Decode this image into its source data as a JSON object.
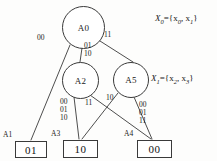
{
  "figure": {
    "type": "decision-diagram",
    "nodes": [
      {
        "id": "A0",
        "label": "A0",
        "cx": 83.5,
        "cy": 27,
        "r": 21
      },
      {
        "id": "A2",
        "label": "A2",
        "cx": 80,
        "cy": 80,
        "r": 18
      },
      {
        "id": "A5",
        "label": "A5",
        "cx": 130.5,
        "cy": 80,
        "r": 17.5
      }
    ],
    "terminals": [
      {
        "id": "A1",
        "name": "A1",
        "value": "01",
        "x": 15,
        "y": 141,
        "w": 30,
        "h": 15,
        "name_x": 3,
        "name_y": 131
      },
      {
        "id": "A3",
        "name": "A3",
        "value": "10",
        "x": 63,
        "y": 140,
        "w": 33,
        "h": 16,
        "name_x": 51,
        "name_y": 130
      },
      {
        "id": "A4",
        "name": "A4",
        "value": "00",
        "x": 137,
        "y": 140,
        "w": 33,
        "h": 16,
        "name_x": 124,
        "name_y": 130
      }
    ],
    "edges": [
      {
        "from": "A0",
        "to": "A1",
        "label": "00",
        "x1": 70,
        "y1": 45,
        "x2": 31,
        "y2": 140,
        "lx": 37,
        "ly": 34
      },
      {
        "from": "A0",
        "to": "A2",
        "label": "01\n10",
        "x1": 82,
        "y1": 48,
        "x2": 80,
        "y2": 62,
        "lx": 84,
        "ly": 42
      },
      {
        "from": "A0",
        "to": "A5",
        "label": "11",
        "x1": 100,
        "y1": 42,
        "x2": 133,
        "y2": 62,
        "lx": 104,
        "ly": 31
      },
      {
        "from": "A2",
        "to": "A3",
        "label": "00\n01\n10",
        "x1": 74,
        "y1": 97,
        "x2": 79,
        "y2": 139,
        "lx": 61,
        "ly": 98
      },
      {
        "from": "A2",
        "to": "A4",
        "label": "11",
        "x1": 90,
        "y1": 95,
        "x2": 151,
        "y2": 139,
        "lx": 85,
        "ly": 99
      },
      {
        "from": "A5",
        "to": "A3",
        "label": "10",
        "x1": 118,
        "y1": 93,
        "x2": 82,
        "y2": 139,
        "lx": 108,
        "ly": 95
      },
      {
        "from": "A5",
        "to": "A4",
        "label": "00\n01\n11",
        "x1": 134,
        "y1": 97,
        "x2": 152,
        "y2": 139,
        "lx": 139,
        "ly": 101
      }
    ],
    "annotations": [
      {
        "id": "X0",
        "var": "X",
        "sub": "0",
        "set": "={x",
        "x": 155,
        "y": 14
      },
      {
        "id": "X1",
        "var": "X",
        "sub": "1",
        "set": "={x",
        "x": 152,
        "y": 74
      }
    ]
  },
  "labels": {
    "x0_set": "X0={x0, x1}",
    "x1_set": "X1={x2, x3}",
    "x0_var": "X",
    "x0_sub": "0",
    "x0_elem1": "0",
    "x0_elem2": "1",
    "x1_var": "X",
    "x1_sub": "1",
    "x1_elem1": "2",
    "x1_elem2": "3",
    "eq_open": "={x",
    "comma": ", x",
    "close": "}"
  },
  "colors": {
    "stroke": "#3a3a3a",
    "text": "#1a1a1a",
    "background": "#fdfdfc",
    "box_fill": "#ffffff"
  }
}
